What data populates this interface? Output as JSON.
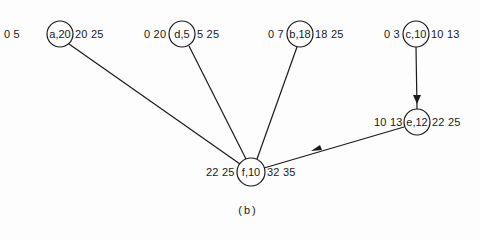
{
  "caption": "(b)",
  "colors": {
    "line": "#1a1a1a",
    "background": "#fdfdfd"
  },
  "nodes": [
    {
      "id": "a",
      "label": "a,20",
      "left": "0 5",
      "right": "20 25"
    },
    {
      "id": "d",
      "label": "d,5",
      "left": "0 20",
      "right": "5 25"
    },
    {
      "id": "b",
      "label": "b,18",
      "left": "0 7",
      "right": "18 25"
    },
    {
      "id": "c",
      "label": "c,10",
      "left": "0 3",
      "right": "10 13"
    },
    {
      "id": "e",
      "label": "e,12",
      "left": "10 13",
      "right": "22 25"
    },
    {
      "id": "f",
      "label": "f,10",
      "left": "22 25",
      "right": "32 35"
    }
  ],
  "edges": [
    {
      "from": "a",
      "to": "f",
      "arrow": false
    },
    {
      "from": "d",
      "to": "f",
      "arrow": false
    },
    {
      "from": "b",
      "to": "f",
      "arrow": false
    },
    {
      "from": "c",
      "to": "e",
      "arrow": true
    },
    {
      "from": "e",
      "to": "f",
      "arrow": true
    }
  ]
}
